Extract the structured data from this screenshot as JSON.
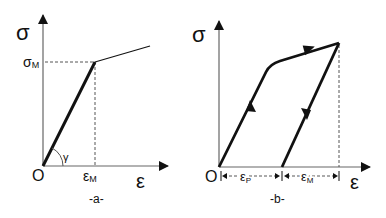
{
  "panel_a": {
    "caption": "-a-",
    "y_axis_label": "σ",
    "x_axis_label": "ε",
    "origin_label": "O",
    "sigma_m_label": "σ",
    "sigma_m_sub": "M",
    "eps_m_label": "ε",
    "eps_m_sub": "M",
    "angle_label": "γ"
  },
  "panel_b": {
    "caption": "-b-",
    "y_axis_label": "σ",
    "x_axis_label": "ε",
    "origin_label": "O",
    "eps_p_label": "ε",
    "eps_p_sub": "P",
    "eps_m_label": "ε",
    "eps_m_sub": "M"
  },
  "colors": {
    "line": "#111111",
    "axis": "#555555",
    "dashed": "#555555"
  }
}
